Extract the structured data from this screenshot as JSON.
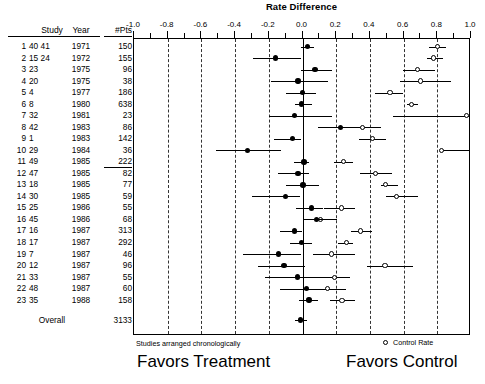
{
  "chart_title": "Rate Difference",
  "columns": {
    "study": "Study",
    "year": "Year",
    "pts": "#Pts"
  },
  "footnotes": {
    "chronological_note": "Studies arranged chronologically",
    "favors_treatment": "Favors Treatment",
    "favors_control": "Favors Control",
    "legend_control_rate": "Control Rate",
    "legend_marker_icon": "open-circle-icon",
    "treatment_marker_icon": "filled-circle-icon"
  },
  "overall": {
    "label": "Overall",
    "pts": "3133"
  },
  "chart_data": {
    "type": "scatter",
    "title": "Rate Difference",
    "xlabel": "Rate Difference",
    "ylabel": "",
    "xlim": [
      -1.0,
      1.0
    ],
    "grid": true,
    "grid_style": "dashed vertical at major ticks",
    "legend_position": "bottom-right",
    "tick_labels": [
      "-1.0",
      "-0.8",
      "-0.6",
      "-0.4",
      "-0.2",
      "0.0",
      "0.2",
      "0.4",
      "0.6",
      "0.8",
      "1.0"
    ],
    "tick_values": [
      -1.0,
      -0.8,
      -0.6,
      -0.4,
      -0.2,
      0.0,
      0.2,
      0.4,
      0.6,
      0.8,
      1.0
    ],
    "minor_tick_values": [
      -0.9,
      -0.7,
      -0.5,
      -0.3,
      -0.1,
      0.1,
      0.3,
      0.5,
      0.7,
      0.9
    ],
    "series": [
      {
        "name": "Rate Difference",
        "marker": "filled-circle"
      },
      {
        "name": "Control Rate",
        "marker": "open-circle"
      }
    ],
    "rows": [
      {
        "idx": "1",
        "refs": "40 41",
        "year": "1971",
        "pts": "150",
        "rd": 0.035,
        "rd_lo": -0.003,
        "rd_hi": 0.075,
        "cr": 0.805,
        "cr_lo": 0.757,
        "cr_hi": 0.855
      },
      {
        "idx": "2",
        "refs": "15 24",
        "year": "1972",
        "pts": "155",
        "rd": -0.155,
        "rd_lo": -0.29,
        "rd_hi": 0.0,
        "cr": 0.785,
        "cr_lo": 0.742,
        "cr_hi": 0.838
      },
      {
        "idx": "3",
        "refs": "23",
        "year": "1975",
        "pts": "96",
        "rd": 0.08,
        "rd_lo": -0.005,
        "rd_hi": 0.18,
        "cr": 0.69,
        "cr_lo": 0.605,
        "cr_hi": 0.79
      },
      {
        "idx": "4",
        "refs": "20",
        "year": "1975",
        "pts": "38",
        "rd": -0.02,
        "rd_lo": -0.18,
        "rd_hi": 0.155,
        "cr": 0.705,
        "cr_lo": 0.585,
        "cr_hi": 0.885
      },
      {
        "idx": "5",
        "refs": "4",
        "year": "1977",
        "pts": "186",
        "rd": 0.005,
        "rd_lo": -0.09,
        "rd_hi": 0.085,
        "cr": 0.525,
        "cr_lo": 0.437,
        "cr_hi": 0.605
      },
      {
        "idx": "6",
        "refs": "8",
        "year": "1980",
        "pts": "638",
        "rd": 0.0,
        "rd_lo": -0.04,
        "rd_hi": 0.06,
        "cr": 0.655,
        "cr_lo": 0.625,
        "cr_hi": 0.69
      },
      {
        "idx": "7",
        "refs": "32",
        "year": "1981",
        "pts": "23",
        "rd": -0.04,
        "rd_lo": -0.19,
        "rd_hi": 0.18,
        "cr": 0.98,
        "cr_lo": 0.545,
        "cr_hi": 1.0
      },
      {
        "idx": "8",
        "refs": "42",
        "year": "1983",
        "pts": "86",
        "rd": 0.23,
        "rd_lo": 0.095,
        "rd_hi": 0.29,
        "cr": 0.36,
        "cr_lo": 0.225,
        "cr_hi": 0.47
      },
      {
        "idx": "9",
        "refs": "1",
        "year": "1983",
        "pts": "142",
        "rd": -0.055,
        "rd_lo": -0.165,
        "rd_hi": 0.0,
        "cr": 0.42,
        "cr_lo": 0.34,
        "cr_hi": 0.5
      },
      {
        "idx": "10",
        "refs": "29",
        "year": "1984",
        "pts": "36",
        "rd": -0.32,
        "rd_lo": -0.51,
        "rd_hi": -0.12,
        "cr": 0.83,
        "cr_lo": 0.83,
        "cr_hi": 1.0
      },
      {
        "idx": "11",
        "refs": "49",
        "year": "1985",
        "pts": "222",
        "rd": 0.015,
        "rd_lo": -0.045,
        "rd_hi": 0.045,
        "cr": 0.25,
        "cr_lo": 0.195,
        "cr_hi": 0.305
      },
      {
        "idx": "12",
        "refs": "47",
        "year": "1985",
        "pts": "82",
        "rd": -0.02,
        "rd_lo": -0.14,
        "rd_hi": 0.045,
        "cr": 0.44,
        "cr_lo": 0.35,
        "cr_hi": 0.535
      },
      {
        "idx": "13",
        "refs": "18",
        "year": "1985",
        "pts": "77",
        "rd": 0.01,
        "rd_lo": -0.09,
        "rd_hi": 0.105,
        "cr": 0.5,
        "cr_lo": 0.47,
        "cr_hi": 0.57
      },
      {
        "idx": "14",
        "refs": "30",
        "year": "1985",
        "pts": "59",
        "rd": -0.095,
        "rd_lo": -0.295,
        "rd_hi": -0.01,
        "cr": 0.565,
        "cr_lo": 0.5,
        "cr_hi": 0.69
      },
      {
        "idx": "15",
        "refs": "25",
        "year": "1986",
        "pts": "55",
        "rd": 0.06,
        "rd_lo": -0.035,
        "rd_hi": 0.13,
        "cr": 0.235,
        "cr_lo": 0.135,
        "cr_hi": 0.32
      },
      {
        "idx": "16",
        "refs": "45",
        "year": "1986",
        "pts": "68",
        "rd": 0.09,
        "rd_lo": 0.01,
        "rd_hi": 0.2,
        "cr": 0.115,
        "cr_lo": 0.03,
        "cr_hi": 0.21
      },
      {
        "idx": "17",
        "refs": "16",
        "year": "1987",
        "pts": "313",
        "rd": -0.04,
        "rd_lo": -0.125,
        "rd_hi": 0.0,
        "cr": 0.35,
        "cr_lo": 0.295,
        "cr_hi": 0.42
      },
      {
        "idx": "18",
        "refs": "17",
        "year": "1987",
        "pts": "292",
        "rd": 0.0,
        "rd_lo": -0.07,
        "rd_hi": 0.065,
        "cr": 0.265,
        "cr_lo": 0.215,
        "cr_hi": 0.305
      },
      {
        "idx": "19",
        "refs": "7",
        "year": "1987",
        "pts": "46",
        "rd": -0.135,
        "rd_lo": -0.35,
        "rd_hi": 0.0,
        "cr": 0.18,
        "cr_lo": 0.07,
        "cr_hi": 0.315
      },
      {
        "idx": "20",
        "refs": "12",
        "year": "1987",
        "pts": "96",
        "rd": -0.105,
        "rd_lo": -0.26,
        "rd_hi": 0.02,
        "cr": 0.495,
        "cr_lo": 0.39,
        "cr_hi": 0.66
      },
      {
        "idx": "21",
        "refs": "33",
        "year": "1987",
        "pts": "55",
        "rd": -0.025,
        "rd_lo": -0.215,
        "rd_hi": 0.105,
        "cr": 0.195,
        "cr_lo": 0.1,
        "cr_hi": 0.29
      },
      {
        "idx": "22",
        "refs": "48",
        "year": "1987",
        "pts": "60",
        "rd": 0.03,
        "rd_lo": -0.125,
        "rd_hi": 0.105,
        "cr": 0.155,
        "cr_lo": 0.075,
        "cr_hi": 0.265
      },
      {
        "idx": "23",
        "refs": "35",
        "year": "1988",
        "pts": "158",
        "rd": 0.045,
        "rd_lo": -0.015,
        "rd_hi": 0.095,
        "cr": 0.24,
        "cr_lo": 0.17,
        "cr_hi": 0.32
      }
    ],
    "overall_row": {
      "label": "Overall",
      "pts": "3133",
      "rd": -0.005,
      "rd_lo": -0.04,
      "rd_hi": 0.03
    }
  }
}
